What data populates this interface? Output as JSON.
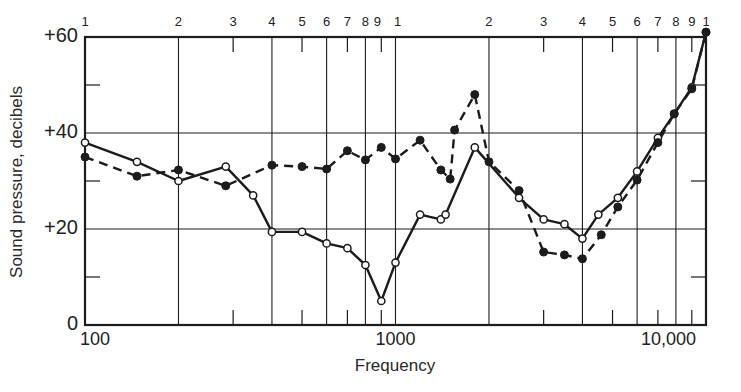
{
  "chart_data": {
    "type": "line",
    "title": "",
    "xlabel": "Frequency",
    "ylabel": "Sound pressure, decibels",
    "xscale": "log",
    "xlim": [
      100,
      10000
    ],
    "ylim": [
      0,
      61
    ],
    "grid": true,
    "legend": null,
    "y_tick_labels": [
      {
        "value": 60,
        "label": "+60"
      },
      {
        "value": 40,
        "label": "+40"
      },
      {
        "value": 20,
        "label": "+20"
      },
      {
        "value": 0,
        "label": "0"
      }
    ],
    "y_minor_ticks": [
      10,
      30,
      50
    ],
    "x_tick_labels": [
      {
        "value": 100,
        "label": "100"
      },
      {
        "value": 1000,
        "label": "1000"
      },
      {
        "value": 10000,
        "label": "10,000"
      }
    ],
    "top_cycle_labels": [
      {
        "value": 100,
        "label": "1"
      },
      {
        "value": 200,
        "label": "2"
      },
      {
        "value": 300,
        "label": "3"
      },
      {
        "value": 400,
        "label": "4"
      },
      {
        "value": 500,
        "label": "5"
      },
      {
        "value": 600,
        "label": "6"
      },
      {
        "value": 700,
        "label": "7"
      },
      {
        "value": 800,
        "label": "8"
      },
      {
        "value": 900,
        "label": "9"
      },
      {
        "value": 1000,
        "label": "1"
      },
      {
        "value": 2000,
        "label": "2"
      },
      {
        "value": 3000,
        "label": "3"
      },
      {
        "value": 4000,
        "label": "4"
      },
      {
        "value": 5000,
        "label": "5"
      },
      {
        "value": 6000,
        "label": "6"
      },
      {
        "value": 7000,
        "label": "7"
      },
      {
        "value": 8000,
        "label": "8"
      },
      {
        "value": 9000,
        "label": "9"
      },
      {
        "value": 10000,
        "label": "1"
      }
    ],
    "major_gridlines_x": [
      200,
      400,
      600,
      800,
      1000,
      2000,
      4000,
      6000,
      8000
    ],
    "minor_ticks_x": [
      300,
      500,
      700,
      900,
      3000,
      5000,
      7000,
      9000
    ],
    "gridlines_y": [
      20,
      40
    ],
    "series": [
      {
        "name": "solid-open-circles",
        "style": "solid",
        "marker": "open-circle",
        "points": [
          [
            100,
            38
          ],
          [
            147,
            34
          ],
          [
            200,
            30
          ],
          [
            284,
            33
          ],
          [
            348,
            27
          ],
          [
            400,
            19.4
          ],
          [
            500,
            19.4
          ],
          [
            600,
            17
          ],
          [
            700,
            16
          ],
          [
            800,
            12.5
          ],
          [
            900,
            5
          ],
          [
            1000,
            13
          ],
          [
            1200,
            23
          ],
          [
            1400,
            22
          ],
          [
            1450,
            23
          ],
          [
            1800,
            37
          ],
          [
            2500,
            26.5
          ],
          [
            3000,
            22
          ],
          [
            3500,
            21
          ],
          [
            4000,
            18
          ],
          [
            4500,
            23
          ],
          [
            5200,
            26.5
          ],
          [
            6000,
            32
          ],
          [
            7000,
            39
          ],
          [
            7900,
            44
          ],
          [
            9000,
            49.5
          ],
          [
            10000,
            61
          ]
        ]
      },
      {
        "name": "dashed-filled-circles",
        "style": "dashed",
        "marker": "filled-circle",
        "points": [
          [
            100,
            35
          ],
          [
            147,
            31
          ],
          [
            200,
            32.3
          ],
          [
            284,
            29
          ],
          [
            400,
            33.3
          ],
          [
            500,
            33
          ],
          [
            600,
            32.5
          ],
          [
            700,
            36.3
          ],
          [
            800,
            34.4
          ],
          [
            900,
            37
          ],
          [
            1000,
            34.6
          ],
          [
            1200,
            38.5
          ],
          [
            1400,
            32.3
          ],
          [
            1500,
            30.4
          ],
          [
            1550,
            40.6
          ],
          [
            1800,
            48
          ],
          [
            2000,
            34
          ],
          [
            2500,
            28
          ],
          [
            3000,
            15.2
          ],
          [
            3500,
            14.6
          ],
          [
            4000,
            13.8
          ],
          [
            4600,
            18.8
          ],
          [
            5200,
            24.6
          ],
          [
            6000,
            30.2
          ],
          [
            7000,
            38
          ],
          [
            7900,
            44
          ],
          [
            9000,
            49.2
          ],
          [
            10000,
            61
          ]
        ]
      }
    ]
  },
  "labels": {
    "ylabel": "Sound pressure, decibels",
    "xlabel": "Frequency"
  }
}
